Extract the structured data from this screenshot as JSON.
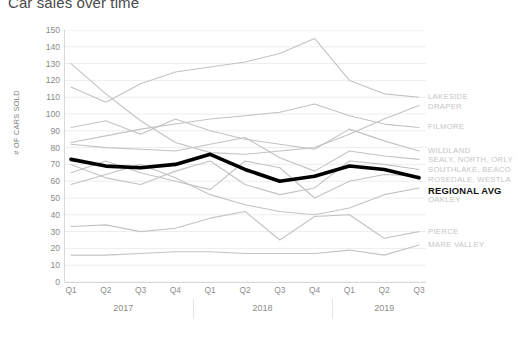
{
  "chart_data": {
    "type": "line",
    "title": "Car sales over time",
    "xlabel": "",
    "ylabel": "# OF CARS SOLD",
    "ylim": [
      0,
      150
    ],
    "ytick_step": 10,
    "yticks": [
      150,
      140,
      130,
      120,
      110,
      100,
      90,
      80,
      70,
      60,
      50,
      40,
      30,
      20,
      10,
      0
    ],
    "grid": true,
    "legend_position": "right",
    "categories": [
      "Q1",
      "Q2",
      "Q3",
      "Q4",
      "Q1",
      "Q2",
      "Q3",
      "Q4",
      "Q1",
      "Q2",
      "Q3"
    ],
    "x_groups": [
      {
        "label": "2017",
        "span": 4
      },
      {
        "label": "2018",
        "span": 4
      },
      {
        "label": "2019",
        "span": 3
      }
    ],
    "colors": {
      "series_default": "#c3c3c3",
      "highlight": "#000000",
      "grid": "#ededed",
      "axis": "#d8d8d8",
      "tick_text": "#8a8a8a",
      "title_text": "#4a4a4a",
      "legend_text": "#c6c6c6",
      "legend_highlight_text": "#111111"
    },
    "series": [
      {
        "name": "LAKESIDE",
        "highlight": false,
        "legend_label": "LAKESIDE",
        "values": [
          116,
          107,
          118,
          125,
          128,
          131,
          136,
          145,
          120,
          112,
          110
        ]
      },
      {
        "name": "DRAPER",
        "highlight": false,
        "legend_label": "DRAPER",
        "values": [
          130,
          112,
          96,
          83,
          77,
          76,
          78,
          80,
          88,
          97,
          105
        ]
      },
      {
        "name": "FILMORE",
        "highlight": false,
        "legend_label": "FILMORE",
        "values": [
          83,
          87,
          91,
          94,
          97,
          99,
          101,
          106,
          99,
          94,
          92
        ]
      },
      {
        "name": "WILDLAND",
        "highlight": false,
        "legend_label": "WILDLAND",
        "values": [
          92,
          96,
          88,
          97,
          90,
          85,
          82,
          79,
          91,
          84,
          78
        ]
      },
      {
        "name": "SEALY, NORTH, ORLY",
        "highlight": false,
        "legend_label": "SEALY, NORTH, ORLY",
        "values": [
          82,
          80,
          79,
          78,
          82,
          86,
          74,
          66,
          78,
          75,
          73
        ]
      },
      {
        "name": "REGIONAL AVG",
        "highlight": true,
        "legend_label": "REGIONAL AVG",
        "values": [
          73,
          69,
          68,
          70,
          76,
          67,
          60,
          63,
          69,
          67,
          62
        ]
      },
      {
        "name": "SOUTHLAKE, BEACON",
        "highlight": false,
        "legend_label": "SOUTHLAKE, BEACO",
        "values": [
          70,
          62,
          58,
          66,
          72,
          58,
          52,
          56,
          72,
          70,
          67
        ]
      },
      {
        "name": "ROSEDALE, WESTLAKE",
        "highlight": false,
        "legend_label": "ROSEDALE, WESTLA",
        "values": [
          65,
          72,
          65,
          60,
          55,
          72,
          68,
          50,
          60,
          64,
          63
        ]
      },
      {
        "name": "OAKLEY",
        "highlight": false,
        "legend_label": "OAKLEY",
        "values": [
          58,
          64,
          70,
          62,
          52,
          46,
          42,
          40,
          44,
          52,
          56
        ]
      },
      {
        "name": "PIERCE",
        "highlight": false,
        "legend_label": "PIERCE",
        "values": [
          33,
          34,
          30,
          32,
          38,
          42,
          25,
          39,
          40,
          26,
          30
        ]
      },
      {
        "name": "MARE VALLEY",
        "highlight": false,
        "legend_label": "MARE VALLEY",
        "values": [
          16,
          16,
          17,
          18,
          18,
          17,
          17,
          17,
          19,
          16,
          22
        ]
      }
    ]
  }
}
